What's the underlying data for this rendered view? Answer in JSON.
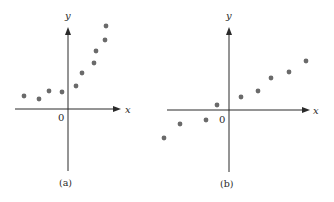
{
  "figure": {
    "panels": [
      {
        "caption": "(a)",
        "x_axis_label": "x",
        "y_axis_label": "y",
        "origin_label": "0"
      },
      {
        "caption": "(b)",
        "x_axis_label": "x",
        "y_axis_label": "y",
        "origin_label": "0"
      }
    ],
    "point_color": "#6a6a6a",
    "axis_color": "#2a2a2a"
  },
  "chart_data": [
    {
      "type": "scatter",
      "title": "(a)",
      "xlabel": "x",
      "ylabel": "y",
      "grid": false,
      "ticks": false,
      "description": "Nonlinear (curved upward) relationship: roughly flat for x<0, rising steeply for x>0",
      "x": [
        -4.4,
        -2.9,
        -1.9,
        -0.6,
        0.8,
        1.4,
        2.6,
        2.8,
        3.7,
        3.8
      ],
      "y": [
        1.3,
        1.0,
        1.8,
        1.7,
        2.3,
        3.6,
        4.6,
        5.8,
        6.9,
        8.3
      ],
      "axes_px": {
        "origin": [
          68,
          109
        ],
        "x_range_px": [
          15,
          121
        ],
        "y_range_px": [
          27,
          171
        ]
      },
      "points_px": [
        [
          24,
          96
        ],
        [
          39,
          99
        ],
        [
          49,
          91
        ],
        [
          62,
          92
        ],
        [
          76,
          86
        ],
        [
          82,
          73
        ],
        [
          94,
          63
        ],
        [
          96,
          51
        ],
        [
          105,
          40
        ],
        [
          106,
          26
        ]
      ]
    },
    {
      "type": "scatter",
      "title": "(b)",
      "xlabel": "x",
      "ylabel": "y",
      "grid": false,
      "ticks": false,
      "description": "Approximately linear positive relationship passing near the origin",
      "x": [
        -6.5,
        -4.9,
        -2.3,
        -1.2,
        1.2,
        2.9,
        4.2,
        6.0,
        7.7
      ],
      "y": [
        -2.8,
        -1.4,
        -1.0,
        0.5,
        1.3,
        1.9,
        3.2,
        3.8,
        4.9
      ],
      "axes_px": {
        "origin": [
          229,
          110
        ],
        "x_range_px": [
          167,
          310
        ],
        "y_range_px": [
          27,
          172
        ]
      },
      "points_px": [
        [
          164,
          138
        ],
        [
          180,
          124
        ],
        [
          206,
          120
        ],
        [
          217,
          105
        ],
        [
          241,
          97
        ],
        [
          258,
          91
        ],
        [
          271,
          78
        ],
        [
          289,
          72
        ],
        [
          306,
          61
        ]
      ]
    }
  ]
}
